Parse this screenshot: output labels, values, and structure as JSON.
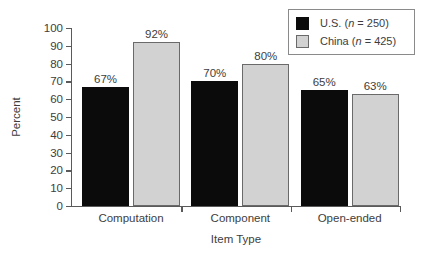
{
  "chart_data": {
    "type": "bar",
    "title": "",
    "subtitle": "",
    "xlabel": "Item Type",
    "ylabel": "Percent",
    "categories": [
      "Computation",
      "Component",
      "Open-ended"
    ],
    "series": [
      {
        "name": "U.S. (n = 250)",
        "legend_prefix": "U.S. (",
        "legend_italic": "n",
        "legend_suffix": " = 250)",
        "color": "#0b0b0b",
        "values": [
          67,
          70,
          65
        ],
        "value_labels": [
          "67%",
          "70%",
          "65%"
        ]
      },
      {
        "name": "China (n = 425)",
        "legend_prefix": "China (",
        "legend_italic": "n",
        "legend_suffix": " = 425)",
        "color": "#d2d2d2",
        "values": [
          92,
          80,
          63
        ],
        "value_labels": [
          "92%",
          "80%",
          "63%"
        ]
      }
    ],
    "ylim": [
      0,
      100
    ],
    "ytick_step": 10,
    "ytick_labels": [
      "0",
      "10",
      "20",
      "30",
      "40",
      "50",
      "60",
      "70",
      "80",
      "90",
      "100"
    ],
    "grid": false,
    "legend_position": "top-right",
    "axis_color": "#5a5a5a",
    "text_color": "#3d3d3d",
    "background": "#ffffff"
  },
  "axes": {
    "y_title": "Percent",
    "x_title": "Item Type"
  },
  "legend": {
    "border_color": "#8a8a8a",
    "entries": [
      {
        "label": "U.S. (n = 250)",
        "swatch": "us"
      },
      {
        "label": "China (n = 425)",
        "swatch": "china"
      }
    ]
  }
}
